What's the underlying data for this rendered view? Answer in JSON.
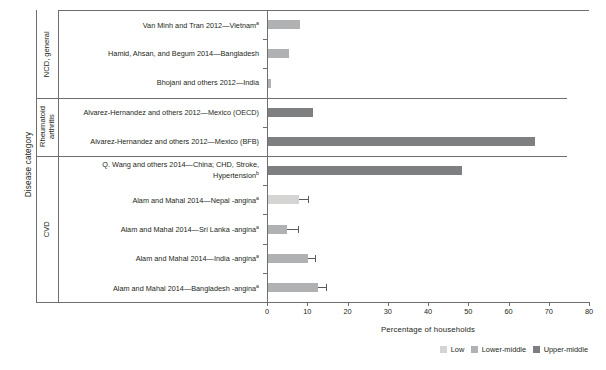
{
  "chart_data": {
    "type": "bar",
    "orientation": "horizontal",
    "title": "",
    "xlabel": "Percentage of households",
    "ylabel": "Disease category",
    "xlim": [
      0,
      80
    ],
    "xticks": [
      0,
      10,
      20,
      30,
      40,
      50,
      60,
      70,
      80
    ],
    "grid": false,
    "legend_position": "bottom-right",
    "legend": [
      {
        "label": "Low",
        "color": "#d4d4d2"
      },
      {
        "label": "Lower-middle",
        "color": "#b0b1b2"
      },
      {
        "label": "Upper-middle",
        "color": "#7e7f81"
      }
    ],
    "groups": [
      {
        "name": "NCD, general",
        "bars": [
          {
            "label": "Van Minh and Tran 2012—Vietnam",
            "sup": "a",
            "value": 8.2,
            "series": "Lower-middle",
            "error": null
          },
          {
            "label": "Hamid, Ahsan, and Begum 2014—Bangladesh",
            "sup": "",
            "value": 5.4,
            "series": "Lower-middle",
            "error": null
          },
          {
            "label": "Bhojani and others 2012—India",
            "sup": "",
            "value": 1.0,
            "series": "Lower-middle",
            "error": null
          }
        ]
      },
      {
        "name": "Rheumatoid arthritis",
        "bars": [
          {
            "label": "Alvarez-Hernandez and others 2012—Mexico (OECD)",
            "sup": "",
            "value": 11.5,
            "series": "Upper-middle",
            "error": null
          },
          {
            "label": "Alvarez-Hernandez and others 2012—Mexico (BFB)",
            "sup": "",
            "value": 66.5,
            "series": "Upper-middle",
            "error": null
          }
        ]
      },
      {
        "name": "CVD",
        "bars": [
          {
            "label": "Q. Wang and others 2014—China; CHD, Stroke, Hypertension",
            "sup": "b",
            "value": 48.4,
            "series": "Upper-middle",
            "error": null
          },
          {
            "label": "Alam and Mahal 2014—Nepal -angina",
            "sup": "a",
            "value": 8.0,
            "series": "Low",
            "error": [
              8.0,
              10.4
            ]
          },
          {
            "label": "Alam and Mahal 2014—Sri Lanka -angina",
            "sup": "a",
            "value": 5.0,
            "series": "Lower-middle",
            "error": [
              5.0,
              8.0
            ]
          },
          {
            "label": "Alam and Mahal 2014—India -angina",
            "sup": "a",
            "value": 10.2,
            "series": "Lower-middle",
            "error": [
              10.2,
              12.2
            ]
          },
          {
            "label": "Alam and Mahal 2014—Bangladesh -angina",
            "sup": "a",
            "value": 12.6,
            "series": "Lower-middle",
            "error": [
              12.6,
              15.0
            ]
          }
        ]
      }
    ]
  }
}
